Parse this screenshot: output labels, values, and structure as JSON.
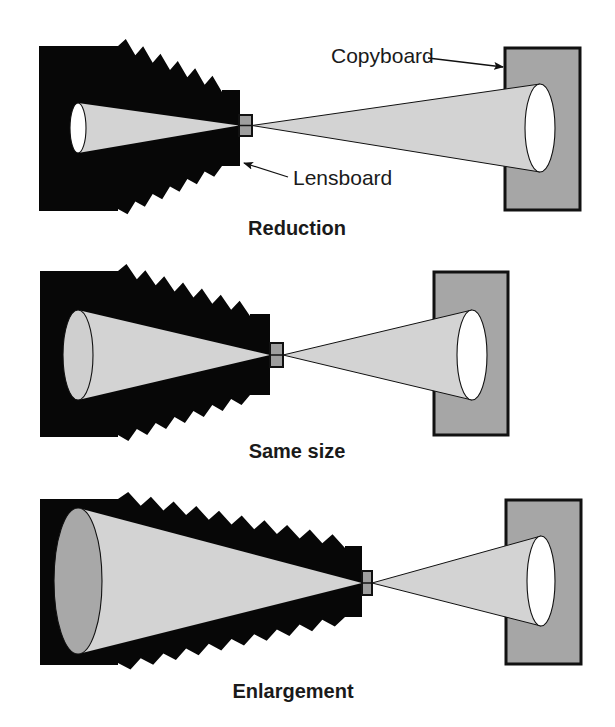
{
  "figure": {
    "colors": {
      "bellows": "#070707",
      "cone": "#d3d3d3",
      "copyboard": "#a6a6a6",
      "copy_image": "#ffffff",
      "film_image_small": "#ffffff",
      "film_image_mid": "#cfcfcf",
      "film_image_large": "#a8a8a8",
      "lens": "#9e9e9e",
      "outline": "#111111",
      "text": "#1a1a1a"
    },
    "callouts": {
      "copyboard": {
        "label": "Copyboard",
        "x": 331,
        "y": 63,
        "arrow_from": [
          428,
          58
        ],
        "arrow_to": [
          503,
          67
        ]
      },
      "lensboard": {
        "label": "Lensboard",
        "x": 293,
        "y": 185,
        "arrow_from": [
          288,
          177
        ],
        "arrow_to": [
          244,
          163
        ]
      }
    },
    "panels": [
      {
        "id": "reduction",
        "caption": "Reduction",
        "caption_x": 297,
        "caption_y": 235,
        "back": {
          "x1": 39,
          "x2": 118,
          "y1": 46,
          "y2": 211
        },
        "front": {
          "x1": 222,
          "x2": 240,
          "y1": 90,
          "y2": 166
        },
        "teeth": 6,
        "lens": {
          "x": 239,
          "y": 115,
          "w": 13,
          "h": 21
        },
        "film_ellipse": {
          "cx": 78,
          "cy": 128,
          "rx": 8,
          "ry": 25,
          "fill_key": "film_image_small"
        },
        "copyboard": {
          "x": 505,
          "y": 48,
          "w": 75,
          "h": 162
        },
        "copy_ellipse": {
          "cx": 540,
          "cy": 128,
          "rx": 15,
          "ry": 44
        }
      },
      {
        "id": "same-size",
        "caption": "Same size",
        "caption_x": 297,
        "caption_y": 458,
        "back": {
          "x1": 40,
          "x2": 118,
          "y1": 271,
          "y2": 437
        },
        "front": {
          "x1": 250,
          "x2": 270,
          "y1": 314,
          "y2": 395
        },
        "teeth": 7,
        "lens": {
          "x": 270,
          "y": 343,
          "w": 13,
          "h": 24
        },
        "film_ellipse": {
          "cx": 78,
          "cy": 355,
          "rx": 15,
          "ry": 45,
          "fill_key": "film_image_mid"
        },
        "copyboard": {
          "x": 434,
          "y": 272,
          "w": 74,
          "h": 163
        },
        "copy_ellipse": {
          "cx": 472,
          "cy": 355,
          "rx": 15,
          "ry": 45
        }
      },
      {
        "id": "enlargement",
        "caption": "Enlargement",
        "caption_x": 293,
        "caption_y": 698,
        "back": {
          "x1": 40,
          "x2": 118,
          "y1": 499,
          "y2": 665
        },
        "front": {
          "x1": 345,
          "x2": 362,
          "y1": 546,
          "y2": 617
        },
        "teeth": 10,
        "lens": {
          "x": 362,
          "y": 571,
          "w": 10,
          "h": 24
        },
        "film_ellipse": {
          "cx": 78,
          "cy": 581,
          "rx": 24,
          "ry": 73,
          "fill_key": "film_image_large"
        },
        "copyboard": {
          "x": 506,
          "y": 500,
          "w": 75,
          "h": 164
        },
        "copy_ellipse": {
          "cx": 541,
          "cy": 581,
          "rx": 14,
          "ry": 45
        }
      }
    ]
  }
}
